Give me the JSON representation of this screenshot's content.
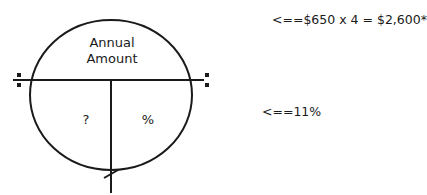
{
  "diagram": {
    "top_label_line1": "Annual",
    "top_label_line2": "Amount",
    "bottom_left_label": "?",
    "bottom_right_label": "%",
    "annotations": [
      {
        "text": "<==$650 x 4 = $2,600*"
      },
      {
        "text": "<==11%"
      }
    ]
  }
}
